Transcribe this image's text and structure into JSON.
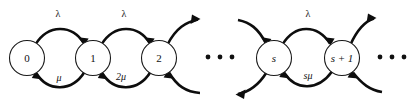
{
  "diagram": {
    "type": "state-transition-diagram",
    "width": 412,
    "height": 100,
    "background_color": "#ffffff",
    "stroke_color": "#0d0d0d",
    "node_fill_color": "#ffffff",
    "nodes": [
      {
        "id": "n0",
        "label": "0",
        "cx": 27,
        "cy": 58,
        "r": 17.5,
        "italic": false
      },
      {
        "id": "n1",
        "label": "1",
        "cx": 93,
        "cy": 58,
        "r": 17.5,
        "italic": false
      },
      {
        "id": "n2",
        "label": "2",
        "cx": 159,
        "cy": 58,
        "r": 17.5,
        "italic": false
      },
      {
        "id": "ns",
        "label": "s",
        "cx": 274,
        "cy": 58,
        "r": 17.5,
        "italic": true
      },
      {
        "id": "ns1",
        "label": "s + 1",
        "cx": 342,
        "cy": 58,
        "r": 17.5,
        "italic": true
      }
    ],
    "ellipses": [
      {
        "id": "e-mid",
        "cx": 220,
        "cy": 57,
        "dots": 3,
        "spacing": 12,
        "radius": 2.4
      },
      {
        "id": "e-right",
        "cx": 392,
        "cy": 57,
        "dots": 3,
        "spacing": 12,
        "radius": 2.4
      }
    ],
    "forward_rate_labels": [
      {
        "id": "lam0",
        "text": "λ",
        "x": 58,
        "y": 15,
        "italic": false
      },
      {
        "id": "lam1",
        "text": "λ",
        "x": 124,
        "y": 15,
        "italic": false
      },
      {
        "id": "lams",
        "text": "λ",
        "x": 308,
        "y": 15,
        "italic": false
      }
    ],
    "backward_rate_labels": [
      {
        "id": "mu1",
        "text": "μ",
        "x": 59,
        "y": 79,
        "italic": true
      },
      {
        "id": "mu2",
        "text": "2μ",
        "x": 121,
        "y": 78,
        "italic": true
      },
      {
        "id": "mus",
        "text": "sμ",
        "x": 308,
        "y": 77,
        "italic": true
      }
    ],
    "edges": [
      {
        "id": "edge-0-1",
        "from": "0",
        "to": "1",
        "direction": "forward",
        "rate": "λ"
      },
      {
        "id": "edge-1-0",
        "from": "1",
        "to": "0",
        "direction": "backward",
        "rate": "μ"
      },
      {
        "id": "edge-1-2",
        "from": "1",
        "to": "2",
        "direction": "forward",
        "rate": "λ"
      },
      {
        "id": "edge-2-1",
        "from": "2",
        "to": "1",
        "direction": "backward",
        "rate": "2μ"
      },
      {
        "id": "edge-2-next",
        "from": "2",
        "to": "next",
        "direction": "forward",
        "rate": ""
      },
      {
        "id": "edge-next-2",
        "from": "next",
        "to": "2",
        "direction": "backward",
        "rate": ""
      },
      {
        "id": "edge-prev-s",
        "from": "prev",
        "to": "s",
        "direction": "forward",
        "rate": ""
      },
      {
        "id": "edge-s-prev",
        "from": "s",
        "to": "prev",
        "direction": "backward",
        "rate": ""
      },
      {
        "id": "edge-s-s1",
        "from": "s",
        "to": "s + 1",
        "direction": "forward",
        "rate": "λ"
      },
      {
        "id": "edge-s1-s",
        "from": "s + 1",
        "to": "s",
        "direction": "backward",
        "rate": "sμ"
      },
      {
        "id": "edge-s1-next",
        "from": "s + 1",
        "to": "next",
        "direction": "forward",
        "rate": ""
      },
      {
        "id": "edge-next-s1",
        "from": "next",
        "to": "s + 1",
        "direction": "backward",
        "rate": ""
      }
    ]
  }
}
